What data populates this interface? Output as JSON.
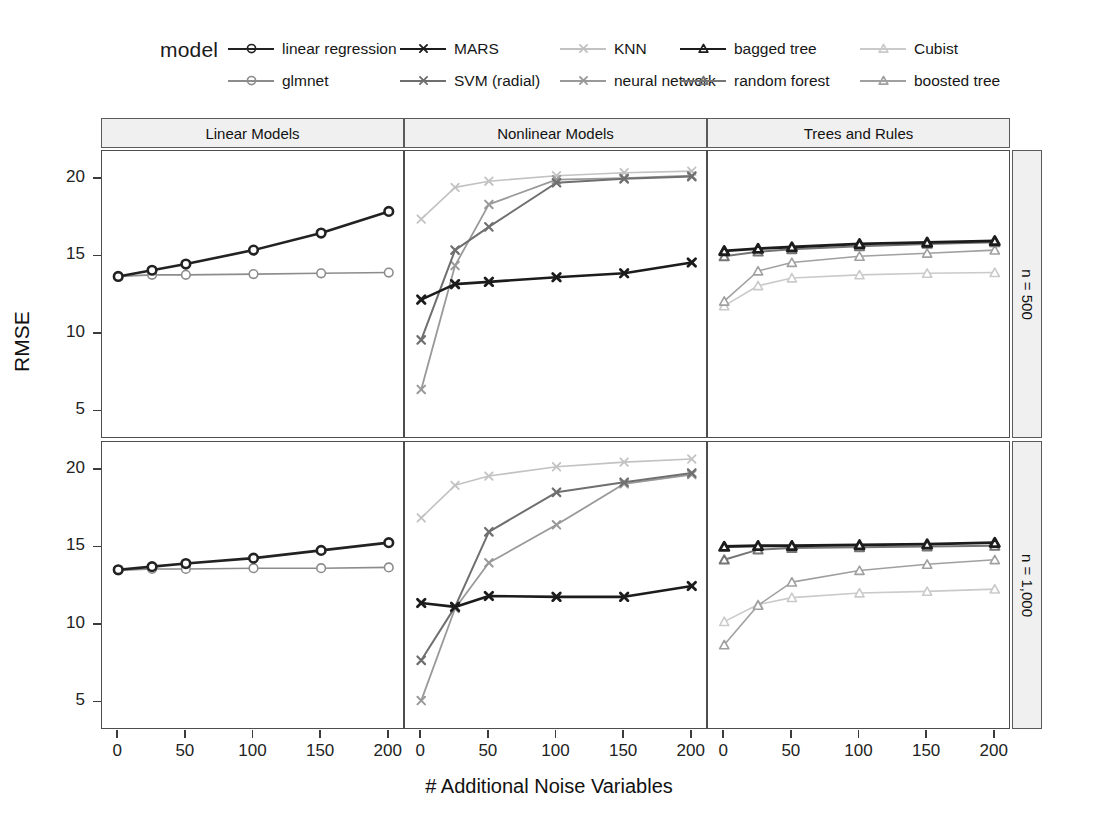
{
  "legend": {
    "title": "model",
    "entries": [
      {
        "label": "linear regression",
        "symbol": "circle",
        "color": "#222222",
        "row": 0,
        "col": 0
      },
      {
        "label": "glmnet",
        "symbol": "circle",
        "color": "#8c8c8c",
        "row": 1,
        "col": 0
      },
      {
        "label": "MARS",
        "symbol": "cross",
        "color": "#1c1c1c",
        "row": 0,
        "col": 1
      },
      {
        "label": "SVM (radial)",
        "symbol": "cross",
        "color": "#6f6f6f",
        "row": 1,
        "col": 1
      },
      {
        "label": "KNN",
        "symbol": "cross",
        "color": "#c2c2c2",
        "row": 0,
        "col": 2
      },
      {
        "label": "neural network",
        "symbol": "cross",
        "color": "#999999",
        "row": 1,
        "col": 2
      },
      {
        "label": "bagged tree",
        "symbol": "triangle",
        "color": "#1c1c1c",
        "row": 0,
        "col": 3
      },
      {
        "label": "random forest",
        "symbol": "triangle",
        "color": "#757575",
        "row": 1,
        "col": 3
      },
      {
        "label": "Cubist",
        "symbol": "triangle",
        "color": "#cacaca",
        "row": 0,
        "col": 4
      },
      {
        "label": "boosted tree",
        "symbol": "triangle",
        "color": "#a0a0a0",
        "row": 1,
        "col": 4
      }
    ]
  },
  "axes": {
    "ylabel": "RMSE",
    "xlabel": "# Additional Noise Variables",
    "yticks": [
      5,
      10,
      15,
      20
    ],
    "xticks": [
      0,
      25,
      50,
      100,
      150,
      200
    ],
    "xtick_labels": [
      "0",
      "50",
      "100",
      "150",
      "200"
    ],
    "xtick_label_values": [
      0,
      50,
      100,
      150,
      200
    ],
    "ylim": [
      3.2,
      21.8
    ],
    "xlim": [
      -12,
      212
    ]
  },
  "strips": {
    "columns": [
      "Linear Models",
      "Nonlinear Models",
      "Trees and Rules"
    ],
    "rows": [
      "n = 500",
      "n = 1,000"
    ]
  },
  "chart_data": {
    "type": "line",
    "title": "",
    "xlabel": "# Additional Noise Variables",
    "ylabel": "RMSE",
    "x": [
      0,
      25,
      50,
      100,
      150,
      200
    ],
    "xlim": [
      -12,
      212
    ],
    "ylim": [
      3.2,
      21.8
    ],
    "grid": false,
    "legend_position": "top",
    "facet_columns": [
      "Linear Models",
      "Nonlinear Models",
      "Trees and Rules"
    ],
    "facet_rows": [
      "n = 500",
      "n = 1,000"
    ],
    "panels": [
      {
        "row": "n = 500",
        "column": "Linear Models",
        "series": [
          {
            "name": "linear regression",
            "symbol": "circle",
            "color": "#222222",
            "width": 2.6,
            "values": [
              13.7,
              14.1,
              14.5,
              15.4,
              16.5,
              17.9
            ]
          },
          {
            "name": "glmnet",
            "symbol": "circle",
            "color": "#8c8c8c",
            "width": 1.6,
            "values": [
              13.7,
              13.8,
              13.8,
              13.85,
              13.9,
              13.95
            ]
          }
        ]
      },
      {
        "row": "n = 500",
        "column": "Nonlinear Models",
        "series": [
          {
            "name": "MARS",
            "symbol": "cross",
            "color": "#1c1c1c",
            "width": 2.6,
            "values": [
              12.2,
              13.2,
              13.35,
              13.65,
              13.9,
              14.6
            ]
          },
          {
            "name": "SVM (radial)",
            "symbol": "cross",
            "color": "#6f6f6f",
            "width": 2.0,
            "values": [
              9.6,
              15.4,
              16.9,
              19.75,
              20.0,
              20.15
            ]
          },
          {
            "name": "KNN",
            "symbol": "cross",
            "color": "#c2c2c2",
            "width": 1.6,
            "values": [
              17.4,
              19.45,
              19.85,
              20.2,
              20.4,
              20.5
            ]
          },
          {
            "name": "neural network",
            "symbol": "cross",
            "color": "#999999",
            "width": 1.8,
            "values": [
              6.4,
              14.4,
              18.35,
              19.95,
              20.05,
              20.2
            ]
          }
        ]
      },
      {
        "row": "n = 500",
        "column": "Trees and Rules",
        "series": [
          {
            "name": "bagged tree",
            "symbol": "triangle",
            "color": "#1c1c1c",
            "width": 2.8,
            "values": [
              15.35,
              15.5,
              15.6,
              15.8,
              15.9,
              16.0
            ]
          },
          {
            "name": "random forest",
            "symbol": "triangle",
            "color": "#757575",
            "width": 2.0,
            "values": [
              15.0,
              15.3,
              15.45,
              15.65,
              15.8,
              15.9
            ]
          },
          {
            "name": "boosted tree",
            "symbol": "triangle",
            "color": "#a0a0a0",
            "width": 1.6,
            "values": [
              12.1,
              14.05,
              14.6,
              15.0,
              15.2,
              15.4
            ]
          },
          {
            "name": "Cubist",
            "symbol": "triangle",
            "color": "#cacaca",
            "width": 1.6,
            "values": [
              11.8,
              13.1,
              13.6,
              13.8,
              13.9,
              13.95
            ]
          }
        ]
      },
      {
        "row": "n = 1,000",
        "column": "Linear Models",
        "series": [
          {
            "name": "linear regression",
            "symbol": "circle",
            "color": "#222222",
            "width": 2.6,
            "values": [
              13.55,
              13.75,
              13.95,
              14.3,
              14.8,
              15.3
            ]
          },
          {
            "name": "glmnet",
            "symbol": "circle",
            "color": "#8c8c8c",
            "width": 1.6,
            "values": [
              13.5,
              13.6,
              13.6,
              13.65,
              13.65,
              13.7
            ]
          }
        ]
      },
      {
        "row": "n = 1,000",
        "column": "Nonlinear Models",
        "series": [
          {
            "name": "MARS",
            "symbol": "cross",
            "color": "#1c1c1c",
            "width": 2.6,
            "values": [
              11.4,
              11.15,
              11.85,
              11.8,
              11.8,
              12.5
            ]
          },
          {
            "name": "SVM (radial)",
            "symbol": "cross",
            "color": "#6f6f6f",
            "width": 2.0,
            "values": [
              7.7,
              11.15,
              16.0,
              18.55,
              19.2,
              19.8
            ]
          },
          {
            "name": "KNN",
            "symbol": "cross",
            "color": "#c2c2c2",
            "width": 1.6,
            "values": [
              16.9,
              19.0,
              19.6,
              20.2,
              20.5,
              20.7
            ]
          },
          {
            "name": "neural network",
            "symbol": "cross",
            "color": "#999999",
            "width": 1.8,
            "values": [
              5.1,
              11.05,
              14.0,
              16.45,
              19.1,
              19.7
            ]
          }
        ]
      },
      {
        "row": "n = 1,000",
        "column": "Trees and Rules",
        "series": [
          {
            "name": "bagged tree",
            "symbol": "triangle",
            "color": "#1c1c1c",
            "width": 2.8,
            "values": [
              15.05,
              15.1,
              15.1,
              15.15,
              15.2,
              15.3
            ]
          },
          {
            "name": "random forest",
            "symbol": "triangle",
            "color": "#757575",
            "width": 2.0,
            "values": [
              14.2,
              14.85,
              14.95,
              15.0,
              15.05,
              15.1
            ]
          },
          {
            "name": "boosted tree",
            "symbol": "triangle",
            "color": "#a0a0a0",
            "width": 1.6,
            "values": [
              8.7,
              11.25,
              12.75,
              13.5,
              13.9,
              14.2
            ]
          },
          {
            "name": "Cubist",
            "symbol": "triangle",
            "color": "#cacaca",
            "width": 1.6,
            "values": [
              10.2,
              11.3,
              11.75,
              12.05,
              12.15,
              12.3
            ]
          }
        ]
      }
    ]
  }
}
